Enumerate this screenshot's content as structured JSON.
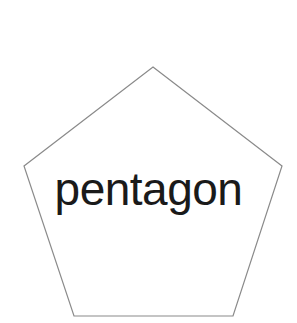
{
  "canvas": {
    "width": 297,
    "height": 323,
    "background_color": "#ffffff"
  },
  "figure": {
    "name": "pentagon",
    "type": "regular-pentagon",
    "sides": 5,
    "stroke_color": "#8a8a8a",
    "stroke_width": 1.2,
    "fill_color": "#ffffff",
    "vertices": [
      {
        "x": 153,
        "y": 67
      },
      {
        "x": 282,
        "y": 166
      },
      {
        "x": 233,
        "y": 316
      },
      {
        "x": 74,
        "y": 316
      },
      {
        "x": 24,
        "y": 166
      }
    ],
    "points_attr": "153,67 282,166 233,316 74,316 24,166"
  },
  "label": {
    "text": "pentagon",
    "color": "#1a1a1a",
    "font_size_px": 46,
    "baseline_y": 208,
    "center_x": 150,
    "top_px": 166
  }
}
